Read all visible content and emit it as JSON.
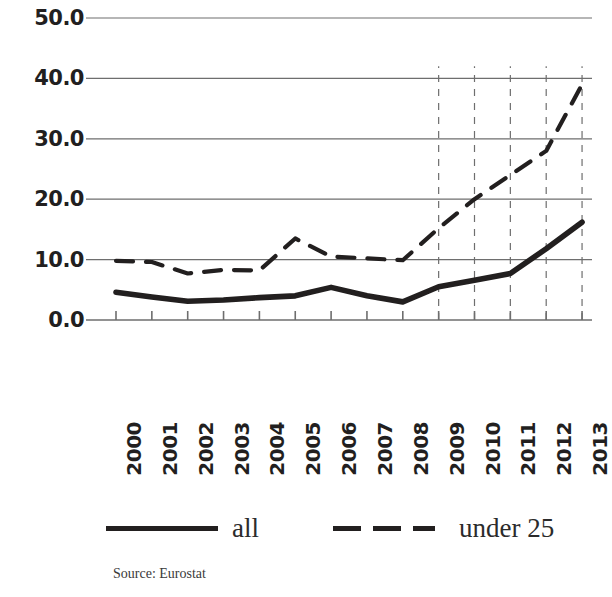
{
  "chart_data": {
    "type": "line",
    "title": "",
    "subtitle": "",
    "xlabel": "",
    "ylabel": "",
    "categories": [
      "2000",
      "2001",
      "2002",
      "2003",
      "2004",
      "2005",
      "2006",
      "2007",
      "2008",
      "2009",
      "2010",
      "2011",
      "2012",
      "2013"
    ],
    "x": [
      2000,
      2001,
      2002,
      2003,
      2004,
      2005,
      2006,
      2007,
      2008,
      2009,
      2010,
      2011,
      2012,
      2013
    ],
    "series": [
      {
        "name": "all",
        "style": "solid",
        "color": "#221f1f",
        "values": [
          4.6,
          3.8,
          3.1,
          3.3,
          3.7,
          4.0,
          5.4,
          4.0,
          3.0,
          5.5,
          6.6,
          7.7,
          11.8,
          16.2
        ]
      },
      {
        "name": "under 25",
        "style": "dashed",
        "color": "#221f1f",
        "values": [
          9.8,
          9.6,
          7.7,
          8.3,
          8.2,
          13.5,
          10.5,
          10.2,
          9.9,
          15.2,
          20.0,
          24.0,
          28.0,
          39.0
        ]
      }
    ],
    "ylim": [
      0,
      50
    ],
    "ytick_values": [
      0,
      10,
      20,
      30,
      40,
      50
    ],
    "ytick_labels": [
      "0.0",
      "10.0",
      "20.0",
      "30.0",
      "40.0",
      "50.0"
    ],
    "xtick_labels": [
      "2000",
      "2001",
      "2002",
      "2003",
      "2004",
      "2005",
      "2006",
      "2007",
      "2008",
      "2009",
      "2010",
      "2011",
      "2012",
      "2013"
    ],
    "grid": {
      "horizontal": true,
      "vertical_dashed_years": [
        2009,
        2010,
        2011,
        2012,
        2013
      ],
      "color": "#6e6e6e"
    },
    "legend": {
      "position": "bottom",
      "entries": [
        {
          "label": "all",
          "style": "solid"
        },
        {
          "label": "under 25",
          "style": "dashed"
        }
      ]
    },
    "source": "Source: Eurostat"
  },
  "axes": {
    "y_labels": [
      "50.0",
      "40.0",
      "30.0",
      "20.0",
      "10.0",
      "0.0"
    ],
    "x_labels": [
      "2000",
      "2001",
      "2002",
      "2003",
      "2004",
      "2005",
      "2006",
      "2007",
      "2008",
      "2009",
      "2010",
      "2011",
      "2012",
      "2013"
    ]
  },
  "legend": {
    "entries": [
      {
        "label": "all"
      },
      {
        "label": "under 25"
      }
    ]
  },
  "footer": {
    "source": "Source: Eurostat"
  }
}
